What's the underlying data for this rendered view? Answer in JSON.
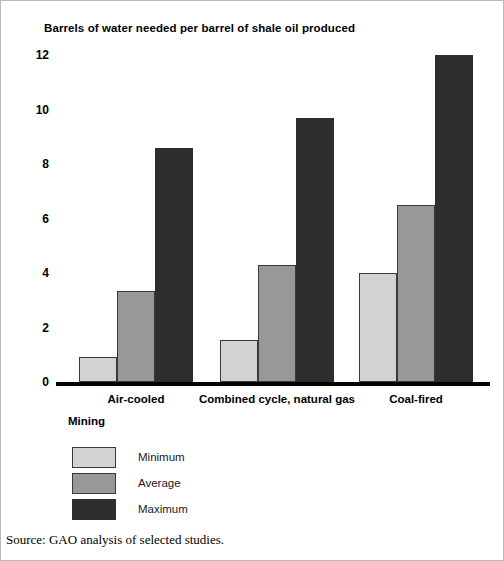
{
  "chart_data": {
    "type": "bar",
    "title": "Barrels of water needed per barrel of shale oil produced",
    "xlabel": "",
    "ylabel": "",
    "ylim": [
      0,
      12
    ],
    "yticks": [
      0,
      2,
      4,
      6,
      8,
      10,
      12
    ],
    "ytick_labels": [
      "0",
      "2",
      "4",
      "6",
      "8",
      "10",
      "12"
    ],
    "grid": false,
    "legend_position": "below-axis-left",
    "legend_title": "Mining",
    "categories": [
      "Air-cooled",
      "Combined cycle, natural gas",
      "Coal-fired"
    ],
    "series": [
      {
        "name": "Minimum",
        "color": "#d2d2d2",
        "values": [
          0.9,
          1.55,
          4.0
        ]
      },
      {
        "name": "Average",
        "color": "#989898",
        "values": [
          3.35,
          4.3,
          6.5
        ]
      },
      {
        "name": "Maximum",
        "color": "#2e2e2e",
        "values": [
          8.6,
          9.7,
          12.0
        ]
      }
    ],
    "annotations": []
  },
  "source": {
    "text": "Source: GAO analysis of selected studies."
  }
}
